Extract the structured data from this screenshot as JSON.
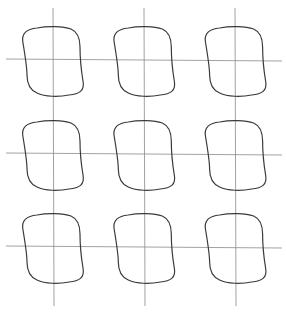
{
  "diagram": {
    "type": "hysteresis-loop-grid",
    "rows": 3,
    "columns": 3,
    "colors": {
      "background": "#ffffff",
      "axis": "#8a8a8a",
      "loop": "#3a3a3a"
    },
    "vertical_axes_x": [
      53,
      144,
      235
    ],
    "horizontal_axes_y": [
      60,
      154,
      247
    ],
    "vertical_axis_extent": [
      8,
      306
    ],
    "horizontal_axis_extent": [
      6,
      282
    ],
    "loop_size": {
      "half_width": 31,
      "half_height": 34
    }
  }
}
